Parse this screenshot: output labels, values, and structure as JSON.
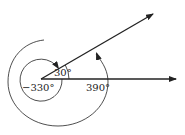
{
  "diagram": {
    "type": "coterminal-angles",
    "labels": {
      "angle_30": "30°",
      "angle_neg330": "−330°",
      "angle_390": "390°"
    },
    "colors": {
      "stroke": "#222222",
      "background": "#ffffff"
    }
  }
}
